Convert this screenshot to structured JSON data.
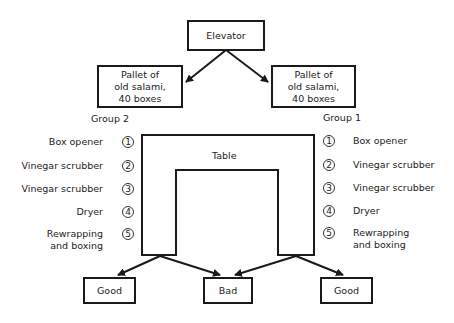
{
  "nodes": {
    "elevator": "Elevator",
    "pallet_left": [
      "Pallet of",
      "old salami,",
      "40 boxes"
    ],
    "pallet_right": [
      "Pallet of",
      "old salami,",
      "40 boxes"
    ],
    "table": "Table",
    "good_left": "Good",
    "bad": "Bad",
    "good_right": "Good"
  },
  "groups": {
    "left": {
      "title": "Group 2",
      "stations": [
        {
          "num": "1",
          "label": [
            "Box opener"
          ]
        },
        {
          "num": "2",
          "label": [
            "Vinegar scrubber"
          ]
        },
        {
          "num": "3",
          "label": [
            "Vinegar scrubber"
          ]
        },
        {
          "num": "4",
          "label": [
            "Dryer"
          ]
        },
        {
          "num": "5",
          "label": [
            "Rewrapping",
            "and boxing"
          ]
        }
      ]
    },
    "right": {
      "title": "Group 1",
      "stations": [
        {
          "num": "1",
          "label": [
            "Box opener"
          ]
        },
        {
          "num": "2",
          "label": [
            "Vinegar scrubber"
          ]
        },
        {
          "num": "3",
          "label": [
            "Vinegar scrubber"
          ]
        },
        {
          "num": "4",
          "label": [
            "Dryer"
          ]
        },
        {
          "num": "5",
          "label": [
            "Rewrapping",
            "and boxing"
          ]
        }
      ]
    }
  },
  "colors": {
    "line": "#1a1a1a",
    "text": "#222222",
    "background": "#ffffff"
  }
}
